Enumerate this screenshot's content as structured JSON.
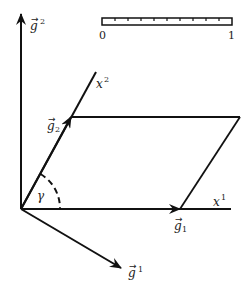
{
  "diagram": {
    "title": "",
    "colors": {
      "stroke": "#111111",
      "label": "#222222",
      "background": "#ffffff"
    },
    "scale_bar": {
      "label_start": "0",
      "label_end": "1",
      "ticks": 9
    },
    "axes": {
      "x1": {
        "label": "x",
        "sup": "1"
      },
      "x2": {
        "label": "x",
        "sup": "2"
      }
    },
    "vectors": {
      "g_sub_1": {
        "label": "g",
        "script": "1",
        "kind": "covariant basis"
      },
      "g_sub_2": {
        "label": "g",
        "script": "2",
        "kind": "covariant basis"
      },
      "g_sup_1": {
        "label": "g",
        "script": "1",
        "kind": "contravariant basis"
      },
      "g_sup_2": {
        "label": "g",
        "script": "2",
        "kind": "contravariant basis"
      }
    },
    "angle": {
      "label": "γ"
    }
  }
}
